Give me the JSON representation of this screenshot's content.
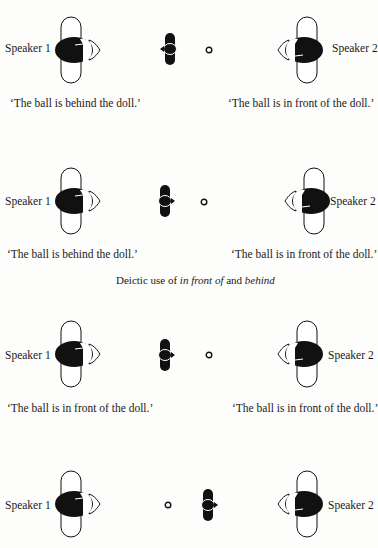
{
  "figure": {
    "heading": {
      "prefix": "Deictic use of ",
      "term1": "in front of",
      "middle": " and ",
      "term2": "behind"
    },
    "scenes": [
      {
        "speaker_left": "Speaker 1",
        "speaker_right": "Speaker 2",
        "caption_left": "‘The ball is  behind the doll.’",
        "caption_right": "‘The ball is in front of the doll.’",
        "doll_facing": "left",
        "order": "doll-ball"
      },
      {
        "speaker_left": "Speaker 1",
        "speaker_right": "Speaker 2",
        "caption_left": "‘The ball is behind the doll.’",
        "caption_right": "‘The ball is in front of the doll.’",
        "doll_facing": "right",
        "order": "doll-ball"
      },
      {
        "speaker_left": "Speaker 1",
        "speaker_right": "Speaker 2",
        "caption_left": "‘The ball is in front of the doll.’",
        "caption_right": "‘The ball is in front of the doll.’",
        "doll_facing": "right",
        "order": "doll-ball"
      },
      {
        "speaker_left": "Speaker 1",
        "speaker_right": "Speaker 2",
        "caption_left": "",
        "caption_right": "",
        "doll_facing": "right",
        "order": "ball-doll"
      }
    ]
  }
}
